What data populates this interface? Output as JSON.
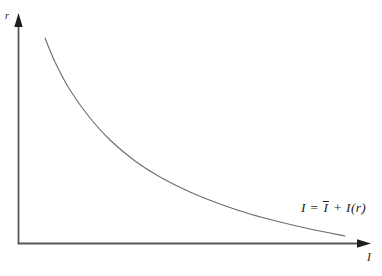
{
  "figure": {
    "background": "#ffffff",
    "axis_color": "#58595b",
    "curve_color": "#6b6c6e",
    "arrow_color": "#231f20",
    "text_color": "#231f20"
  },
  "chart_data": {
    "type": "line",
    "title": "",
    "xlabel": "I",
    "ylabel": "r",
    "grid": false,
    "legend": [],
    "axis_ranges": {
      "x": "unlabeled qualitative axis (investment I)",
      "y": "unlabeled qualitative axis (interest rate r)"
    },
    "series": [
      {
        "name": "investment-demand-curve",
        "label": "I = Ī + I(r)",
        "shape": "convex decreasing (hyperbolic), r falls as I rises",
        "points_px": [
          [
            45,
            38
          ],
          [
            55,
            62
          ],
          [
            70,
            90
          ],
          [
            90,
            118
          ],
          [
            110,
            140
          ],
          [
            135,
            161
          ],
          [
            160,
            177
          ],
          [
            190,
            192
          ],
          [
            220,
            204
          ],
          [
            250,
            214
          ],
          [
            280,
            222
          ],
          [
            310,
            229
          ],
          [
            345,
            236
          ]
        ]
      }
    ],
    "annotation": {
      "equation_full": "I = Ī + I(r)",
      "equation_prefix": "I = ",
      "equation_bar_term": "I",
      "equation_suffix": " + I(r)"
    }
  }
}
